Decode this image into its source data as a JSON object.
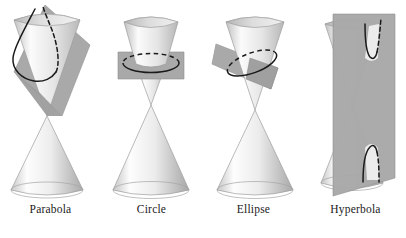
{
  "figure": {
    "background_color": "#ffffff",
    "width": 406,
    "height": 238
  },
  "colors": {
    "plane_fill": "#a9a9a9",
    "plane_fill_dark": "#8f8f8f",
    "plane_edge": "#8a8a8a",
    "cone_light": "#fbfbfb",
    "cone_mid": "#d9d9d9",
    "cone_shadow": "#b4b4b4",
    "cone_interior": "#cfcfcf",
    "curve_stroke": "#1a1a1a",
    "label_text": "#1a1a1a",
    "outline": "#9a9a9a"
  },
  "panels": [
    {
      "id": "parabola",
      "label": "Parabola",
      "curve_type": "parabola",
      "plane_orientation": "oblique-parallel-to-slant",
      "curve_style": {
        "front_arc": "solid",
        "back_arc": "dashed"
      },
      "description": "Plane cuts the upper nappe parallel to a slant line producing an open parabolic curve."
    },
    {
      "id": "circle",
      "label": "Circle",
      "curve_type": "circle",
      "plane_orientation": "horizontal-perpendicular-to-axis",
      "curve_style": {
        "front_arc": "solid",
        "back_arc": "dashed"
      },
      "description": "Horizontal plane perpendicular to the cone axis produces a circle."
    },
    {
      "id": "ellipse",
      "label": "Ellipse",
      "curve_type": "ellipse",
      "plane_orientation": "oblique-tilted",
      "curve_style": {
        "front_arc": "solid",
        "back_arc": "dashed"
      },
      "description": "Tilted plane cutting all slant lines of one nappe produces an ellipse."
    },
    {
      "id": "hyperbola",
      "label": "Hyperbola",
      "curve_type": "hyperbola",
      "plane_orientation": "vertical-parallel-to-axis",
      "curve_style": {
        "front_arc": "solid",
        "back_arc": "dashed"
      },
      "description": "Vertical plane cutting both nappes produces two hyperbolic branches."
    }
  ]
}
